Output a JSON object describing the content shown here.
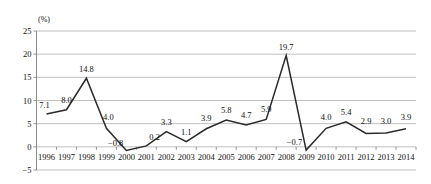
{
  "chart_data": {
    "type": "line",
    "title": "",
    "subtitle": "",
    "xlabel": "",
    "ylabel": "",
    "unit_label": "(%)",
    "grid": true,
    "legend": false,
    "ylim": [
      -5,
      25
    ],
    "yticks": [
      25,
      20,
      15,
      10,
      5,
      0,
      -5
    ],
    "ytick_labels": [
      "25",
      "20",
      "15",
      "10",
      "5",
      "0",
      "-5"
    ],
    "categories": [
      "1996",
      "1997",
      "1998",
      "1999",
      "2000",
      "2001",
      "2002",
      "2003",
      "2004",
      "2005",
      "2006",
      "2007",
      "2008",
      "2009",
      "2010",
      "2011",
      "2012",
      "2013",
      "2014"
    ],
    "values": [
      7.1,
      8.0,
      14.8,
      4.0,
      -0.8,
      0.2,
      3.3,
      1.1,
      3.9,
      5.8,
      4.7,
      5.9,
      19.7,
      -0.7,
      4.0,
      5.4,
      2.9,
      3.0,
      3.9
    ],
    "point_labels": [
      "7.1",
      "8.0",
      "14.8",
      "4.0",
      "-0.8",
      "0.2",
      "3.3",
      "1.1",
      "3.9",
      "5.8",
      "4.7",
      "5.9",
      "19.7",
      "-0.7",
      "4.0",
      "5.4",
      "2.9",
      "3.0",
      "3.9"
    ],
    "series": [
      {
        "name": "rate",
        "values": [
          7.1,
          8.0,
          14.8,
          4.0,
          -0.8,
          0.2,
          3.3,
          1.1,
          3.9,
          5.8,
          4.7,
          5.9,
          19.7,
          -0.7,
          4.0,
          5.4,
          2.9,
          3.0,
          3.9
        ]
      }
    ],
    "colors": {
      "line": "#2b2b2b",
      "grid": "#b9b9b9",
      "axis": "#8a8a8a",
      "text": "#111111",
      "background": "#ffffff"
    }
  }
}
